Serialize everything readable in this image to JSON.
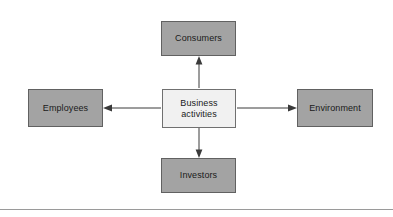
{
  "diagram": {
    "type": "radial-relationship",
    "background_color": "#ffffff",
    "node_fill_color": "#a3a3a3",
    "node_border_color": "#616161",
    "center_fill_color": "#f1f1f1",
    "center_border_color": "#707070",
    "arrow_color": "#3a3a3a",
    "center": {
      "id": "business-activities",
      "label": "Business\nactivities"
    },
    "nodes": [
      {
        "id": "consumers",
        "label": "Consumers",
        "position": "top"
      },
      {
        "id": "employees",
        "label": "Employees",
        "position": "left"
      },
      {
        "id": "environment",
        "label": "Environment",
        "position": "right"
      },
      {
        "id": "investors",
        "label": "Investors",
        "position": "bottom"
      }
    ],
    "connectors": [
      {
        "id": "arrow-to-consumers",
        "from": "business-activities",
        "to": "consumers",
        "direction": "up",
        "style": "solid-single-head"
      },
      {
        "id": "arrow-to-employees",
        "from": "business-activities",
        "to": "employees",
        "direction": "left",
        "style": "solid-single-head"
      },
      {
        "id": "arrow-to-environment",
        "from": "business-activities",
        "to": "environment",
        "direction": "right",
        "style": "solid-single-head"
      },
      {
        "id": "arrow-to-investors",
        "from": "business-activities",
        "to": "investors",
        "direction": "down",
        "style": "solid-single-head"
      }
    ],
    "footer_rule_color": "#9a9a9a"
  }
}
